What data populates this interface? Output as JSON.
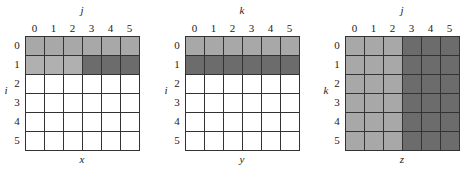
{
  "colors": {
    "white": "#ffffff",
    "mid": "#a8a8a8",
    "light": "#b0b0b0",
    "dark": "#6c6c6c"
  },
  "panels": [
    {
      "id": "x",
      "name": "x",
      "top_axis": "j",
      "left_axis": "i",
      "col_labels": [
        "0",
        "1",
        "2",
        "3",
        "4",
        "5"
      ],
      "row_labels": [
        "0",
        "1",
        "2",
        "3",
        "4",
        "5"
      ],
      "cells": [
        [
          "mid",
          "mid",
          "mid",
          "mid",
          "mid",
          "mid"
        ],
        [
          "light",
          "light",
          "light",
          "dark",
          "dark",
          "dark"
        ],
        [
          "white",
          "white",
          "white",
          "white",
          "white",
          "white"
        ],
        [
          "white",
          "white",
          "white",
          "white",
          "white",
          "white"
        ],
        [
          "white",
          "white",
          "white",
          "white",
          "white",
          "white"
        ],
        [
          "white",
          "white",
          "white",
          "white",
          "white",
          "white"
        ]
      ]
    },
    {
      "id": "y",
      "name": "y",
      "top_axis": "k",
      "left_axis": "i",
      "col_labels": [
        "0",
        "1",
        "2",
        "3",
        "4",
        "5"
      ],
      "row_labels": [
        "0",
        "1",
        "2",
        "3",
        "4",
        "5"
      ],
      "cells": [
        [
          "mid",
          "mid",
          "mid",
          "mid",
          "mid",
          "mid"
        ],
        [
          "dark",
          "dark",
          "dark",
          "dark",
          "dark",
          "dark"
        ],
        [
          "white",
          "white",
          "white",
          "white",
          "white",
          "white"
        ],
        [
          "white",
          "white",
          "white",
          "white",
          "white",
          "white"
        ],
        [
          "white",
          "white",
          "white",
          "white",
          "white",
          "white"
        ],
        [
          "white",
          "white",
          "white",
          "white",
          "white",
          "white"
        ]
      ]
    },
    {
      "id": "z",
      "name": "z",
      "top_axis": "j",
      "left_axis": "k",
      "col_labels": [
        "0",
        "1",
        "2",
        "3",
        "4",
        "5"
      ],
      "row_labels": [
        "0",
        "1",
        "2",
        "3",
        "4",
        "5"
      ],
      "cells": [
        [
          "mid",
          "mid",
          "mid",
          "dark",
          "dark",
          "dark"
        ],
        [
          "mid",
          "mid",
          "mid",
          "dark",
          "dark",
          "dark"
        ],
        [
          "mid",
          "mid",
          "mid",
          "dark",
          "dark",
          "dark"
        ],
        [
          "mid",
          "mid",
          "mid",
          "dark",
          "dark",
          "dark"
        ],
        [
          "mid",
          "mid",
          "mid",
          "dark",
          "dark",
          "dark"
        ],
        [
          "mid",
          "mid",
          "mid",
          "dark",
          "dark",
          "dark"
        ]
      ]
    }
  ]
}
